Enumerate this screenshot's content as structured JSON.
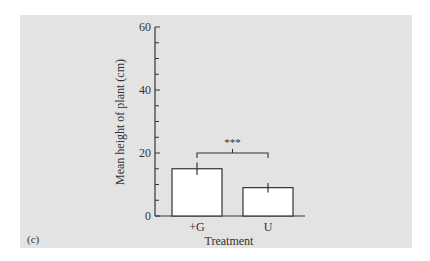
{
  "panel_label": "(c)",
  "chart_data": {
    "type": "bar",
    "title": "",
    "xlabel": "Treatment",
    "ylabel": "Mean height of plant (cm)",
    "ylim": [
      0,
      60
    ],
    "yticks": [
      0,
      20,
      40,
      60
    ],
    "yticks_labels": [
      "0",
      "20",
      "40",
      "60"
    ],
    "minor_tick_step": 5,
    "grid": false,
    "legend": null,
    "categories": [
      "+G",
      "U"
    ],
    "values": [
      15,
      9
    ],
    "error_bars": [
      2,
      1.5
    ],
    "annotations": [
      {
        "type": "significance-bracket",
        "between": [
          "+G",
          "U"
        ],
        "label": "***"
      }
    ],
    "colors": {
      "bar_fill": "#ffffff",
      "bar_stroke": "#333333",
      "background": "#e3e3e3",
      "axis": "#333333"
    }
  }
}
